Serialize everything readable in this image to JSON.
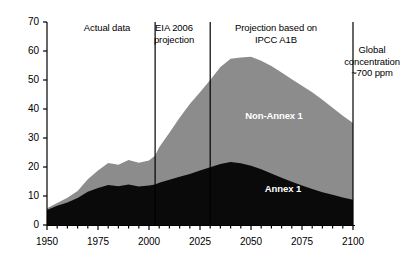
{
  "chart_data": {
    "type": "area",
    "title": "",
    "subtitle": "",
    "xlabel": "",
    "ylabel": "",
    "xlim": [
      1950,
      2100
    ],
    "ylim": [
      0,
      70
    ],
    "stacked": true,
    "grid": false,
    "legend_position": "inline-labels",
    "y_ticks": [
      0,
      10,
      20,
      30,
      40,
      50,
      60,
      70
    ],
    "y_tick_labels": [
      "0",
      "10",
      "20",
      "30",
      "40",
      "50",
      "60",
      "70"
    ],
    "x_ticks": [
      1950,
      1975,
      2000,
      2025,
      2050,
      2075,
      2100
    ],
    "x_tick_labels": [
      "1950",
      "1975",
      "2000",
      "2025",
      "2050",
      "2075",
      "2100"
    ],
    "x_minor_tick_step": 5,
    "x": [
      1950,
      1955,
      1960,
      1965,
      1970,
      1975,
      1980,
      1985,
      1990,
      1995,
      2000,
      2003,
      2005,
      2010,
      2015,
      2020,
      2025,
      2030,
      2035,
      2040,
      2045,
      2050,
      2055,
      2060,
      2065,
      2070,
      2075,
      2080,
      2085,
      2090,
      2095,
      2100
    ],
    "series": [
      {
        "name": "Annex 1",
        "color": "#0a0a0a",
        "label_color": "#ffffff",
        "values": [
          5.2,
          6.6,
          7.8,
          9.3,
          11.5,
          12.8,
          13.8,
          13.4,
          14.0,
          13.3,
          13.6,
          14.0,
          14.6,
          15.6,
          16.6,
          17.6,
          18.8,
          19.9,
          21.0,
          21.7,
          21.3,
          20.4,
          19.2,
          17.8,
          16.3,
          14.9,
          13.6,
          12.4,
          11.3,
          10.4,
          9.5,
          8.7
        ]
      },
      {
        "name": "Non-Annex 1",
        "color": "#8c8c8c",
        "label_color": "#ffffff",
        "values": [
          0.6,
          1.0,
          1.6,
          2.4,
          4.3,
          6.0,
          7.6,
          7.4,
          8.4,
          8.2,
          8.6,
          10.0,
          12.2,
          16.2,
          20.4,
          24.1,
          27.0,
          30.1,
          33.5,
          35.6,
          36.5,
          37.6,
          37.4,
          37.0,
          36.3,
          35.4,
          34.4,
          33.4,
          31.9,
          30.0,
          28.2,
          26.5
        ]
      }
    ],
    "total_peak": {
      "year": 2050,
      "value": 58
    },
    "annex1_peak": {
      "year": 2040,
      "value": 21.7
    },
    "vertical_dividers": [
      {
        "name": "actual-data-end",
        "year": 2003
      },
      {
        "name": "eia-projection-end",
        "year": 2030
      },
      {
        "name": "end-of-projection",
        "year": 2100
      }
    ]
  },
  "annotations": {
    "actual_data": "Actual data",
    "eia_projection": "EIA 2006\nprojection",
    "ipcc_projection": "Projection based on\nIPCC A1B",
    "global_concentration": "Global\nconcentration\n~700 ppm"
  },
  "series_labels": {
    "non_annex_1": "Non-Annex 1",
    "annex_1": "Annex 1"
  }
}
